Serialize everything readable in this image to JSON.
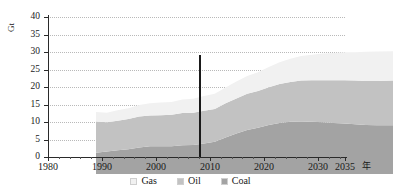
{
  "chart_data": {
    "type": "area",
    "title": "",
    "subtitle": "",
    "xlabel": "年",
    "ylabel": "Gt",
    "xlim": [
      1980,
      2035
    ],
    "ylim": [
      0,
      40
    ],
    "grid": true,
    "legend_position": "bottom",
    "stacked": true,
    "x_ticks": [
      "1980",
      "1990",
      "2000",
      "2010",
      "2020",
      "2030",
      "2035"
    ],
    "x_tick_values": [
      1980,
      1990,
      2000,
      2010,
      2020,
      2030,
      2035
    ],
    "y_ticks": [
      "0",
      "5",
      "10",
      "15",
      "20",
      "25",
      "30",
      "35",
      "40"
    ],
    "y_tick_values": [
      0,
      5,
      10,
      15,
      20,
      25,
      30,
      35,
      40
    ],
    "x": [
      1980,
      1982,
      1984,
      1986,
      1988,
      1990,
      1992,
      1994,
      1996,
      1998,
      2000,
      2002,
      2004,
      2006,
      2008,
      2010,
      2012,
      2014,
      2016,
      2018,
      2020,
      2022,
      2024,
      2026,
      2028,
      2030,
      2032,
      2035
    ],
    "series": [
      {
        "name": "Coal",
        "color": "#a3a3a3",
        "values": [
          6.1,
          6.4,
          6.8,
          7.1,
          7.6,
          7.9,
          7.9,
          7.9,
          8.2,
          8.3,
          8.7,
          9.2,
          10.4,
          11.6,
          12.6,
          13.2,
          14.0,
          14.6,
          14.9,
          15.0,
          14.9,
          14.8,
          14.6,
          14.4,
          14.2,
          14.0,
          13.9,
          13.9
        ]
      },
      {
        "name": "Oil",
        "color": "#c2c2c2",
        "values": [
          8.9,
          8.4,
          8.4,
          8.6,
          8.8,
          8.8,
          8.9,
          9.0,
          9.2,
          9.2,
          9.4,
          9.4,
          9.8,
          10.0,
          10.3,
          10.5,
          10.8,
          11.1,
          11.4,
          11.7,
          11.9,
          12.0,
          12.2,
          12.4,
          12.5,
          12.6,
          12.7,
          12.8
        ]
      },
      {
        "name": "Gas",
        "color": "#f1f1f1",
        "values": [
          2.7,
          2.7,
          3.0,
          3.1,
          3.3,
          3.5,
          3.6,
          3.7,
          3.9,
          4.0,
          4.2,
          4.3,
          4.5,
          4.8,
          5.1,
          5.4,
          5.8,
          6.2,
          6.6,
          7.0,
          7.3,
          7.6,
          7.8,
          8.0,
          8.1,
          8.3,
          8.4,
          8.4
        ]
      }
    ],
    "stack_tops": {
      "coal": [
        6.1,
        6.4,
        6.8,
        7.1,
        7.6,
        7.9,
        7.9,
        7.9,
        8.2,
        8.3,
        8.7,
        9.2,
        10.4,
        11.6,
        12.6,
        13.2,
        14.0,
        14.6,
        14.9,
        15.0,
        14.9,
        14.8,
        14.6,
        14.4,
        14.2,
        14.0,
        13.9,
        13.9
      ],
      "coal_oil": [
        15.0,
        14.8,
        15.2,
        15.7,
        16.4,
        16.7,
        16.8,
        16.9,
        17.4,
        17.5,
        18.1,
        18.6,
        20.2,
        21.6,
        22.9,
        23.7,
        24.8,
        25.7,
        26.3,
        26.7,
        26.8,
        26.8,
        26.8,
        26.8,
        26.7,
        26.6,
        26.6,
        26.7
      ],
      "total": [
        17.7,
        17.5,
        18.2,
        18.8,
        19.7,
        20.2,
        20.4,
        20.6,
        21.3,
        21.5,
        22.3,
        22.9,
        24.7,
        26.4,
        28.0,
        29.1,
        30.6,
        31.9,
        32.9,
        33.7,
        34.1,
        34.4,
        34.6,
        34.8,
        34.8,
        34.9,
        35.0,
        35.1
      ]
    },
    "annotations": [
      {
        "name": "history-projection-divider",
        "type": "vline",
        "x": 2008,
        "y_top": 29.1,
        "y_bottom": 0,
        "color": "#1a1a1a"
      }
    ],
    "legend": [
      {
        "label": "Gas",
        "color": "#f1f1f1"
      },
      {
        "label": "Oil",
        "color": "#c2c2c2"
      },
      {
        "label": "Coal",
        "color": "#a3a3a3"
      }
    ]
  }
}
